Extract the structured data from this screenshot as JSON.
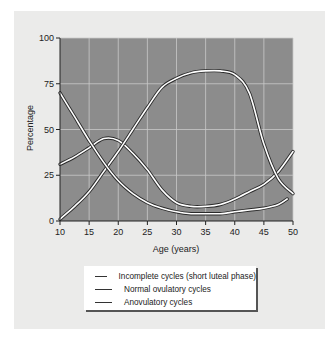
{
  "chart_data": {
    "type": "line",
    "title": "",
    "xlabel": "Age (years)",
    "ylabel": "Percentage",
    "xlim": [
      10,
      50
    ],
    "ylim": [
      0,
      100
    ],
    "x_ticks": [
      10,
      15,
      20,
      25,
      30,
      35,
      40,
      45,
      50
    ],
    "y_ticks": [
      0,
      25,
      50,
      75,
      100
    ],
    "grid": true,
    "legend_position": "bottom",
    "series": [
      {
        "name": "Incomplete cycles (short luteal phase)",
        "x": [
          10,
          12.5,
          15,
          17.5,
          20,
          22.5,
          25,
          27.5,
          30,
          32.5,
          35,
          37.5,
          40,
          42.5,
          45,
          47.5,
          50
        ],
        "values": [
          31,
          35,
          40,
          45,
          44,
          37,
          28,
          17,
          10,
          8,
          8,
          9,
          12,
          16,
          20,
          27,
          38
        ]
      },
      {
        "name": "Normal ovulatory cycles",
        "x": [
          10,
          12.5,
          15,
          17.5,
          20,
          22.5,
          25,
          27.5,
          30,
          32.5,
          35,
          37.5,
          40,
          42.5,
          45,
          47.5,
          50
        ],
        "values": [
          1,
          8,
          16,
          27,
          38,
          50,
          62,
          73,
          78,
          81,
          82,
          82,
          80,
          70,
          42,
          23,
          15
        ]
      },
      {
        "name": "Anovulatory cycles",
        "x": [
          10,
          12.5,
          15,
          17.5,
          20,
          22.5,
          25,
          27.5,
          30,
          32.5,
          35,
          37.5,
          40,
          42.5,
          45,
          47.5,
          49
        ],
        "values": [
          70,
          57,
          44,
          32,
          22,
          15,
          10,
          7,
          5,
          4,
          4,
          4,
          5,
          6,
          7,
          9,
          12
        ]
      }
    ]
  },
  "axes": {
    "xlabel": "Age (years)",
    "ylabel": "Percentage",
    "x_tick_labels": [
      "10",
      "15",
      "20",
      "25",
      "30",
      "35",
      "40",
      "45",
      "50"
    ],
    "y_tick_labels": [
      "0",
      "25",
      "50",
      "75",
      "100"
    ]
  },
  "legend": {
    "items": [
      {
        "label": "Incomplete cycles (short luteal phase)"
      },
      {
        "label": "Normal ovulatory cycles"
      },
      {
        "label": "Anovulatory cycles"
      }
    ]
  },
  "colors": {
    "plot_background": "#8c8c8c",
    "grid": "#c9c9c9",
    "curve_fill": "#ffffff",
    "curve_outline": "#2a2a2a",
    "panel_background": "#ebebea"
  }
}
